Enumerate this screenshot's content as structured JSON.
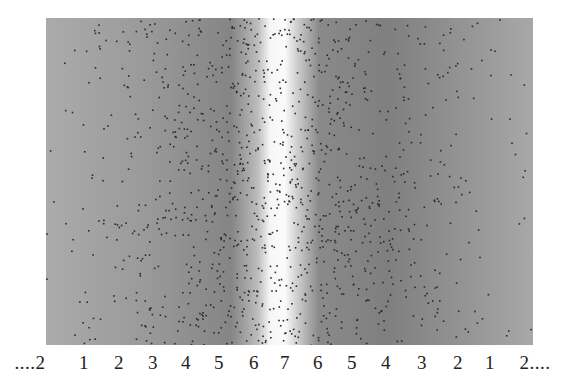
{
  "figure": {
    "band_center_fraction": 0.47,
    "colors": {
      "background": "#ffffff",
      "edge_gray": "#aaaaaa",
      "dark_gray": "#7c7c7c",
      "band_white": "#fbfbfb",
      "dot": "#2a2a2a"
    }
  },
  "scale_labels": [
    {
      "text": "....2",
      "x": 30
    },
    {
      "text": "1",
      "x": 84
    },
    {
      "text": "2",
      "x": 119
    },
    {
      "text": "3",
      "x": 153
    },
    {
      "text": "4",
      "x": 186
    },
    {
      "text": "5",
      "x": 219
    },
    {
      "text": "6",
      "x": 254
    },
    {
      "text": "7",
      "x": 285
    },
    {
      "text": "6",
      "x": 318
    },
    {
      "text": "5",
      "x": 352
    },
    {
      "text": "4",
      "x": 386
    },
    {
      "text": "3",
      "x": 422
    },
    {
      "text": "2",
      "x": 458
    },
    {
      "text": "1",
      "x": 490
    },
    {
      "text": "2....",
      "x": 535
    }
  ]
}
